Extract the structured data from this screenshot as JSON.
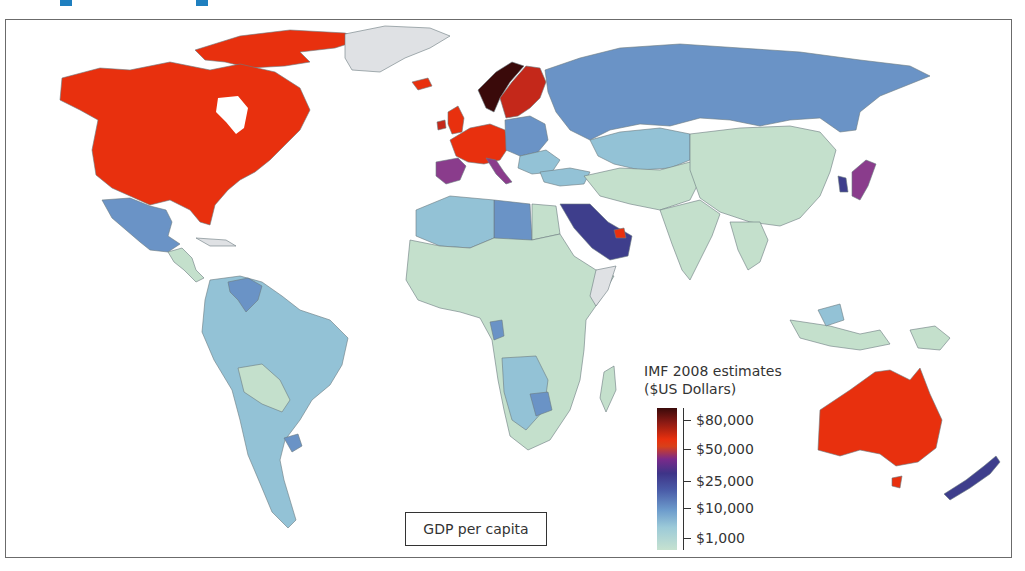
{
  "map": {
    "caption": "GDP per capita",
    "legend": {
      "title_line1": "IMF 2008 estimates",
      "title_line2": "($US Dollars)",
      "ticks": [
        "$80,000",
        "$50,000",
        "$25,000",
        "$10,000",
        "$1,000"
      ]
    },
    "colors": {
      "very_high": "#e8300e",
      "highest": "#3a0a0a",
      "high_purple": "#8a3c8c",
      "upper_mid": "#3e3e8c",
      "mid": "#6a93c6",
      "lower_mid": "#93c2d6",
      "low": "#c4e0cc",
      "no_data": "#dfe1e4"
    },
    "regions": [
      {
        "name": "North America (USA, Canada)",
        "band": "very_high"
      },
      {
        "name": "Greenland",
        "band": "no_data"
      },
      {
        "name": "Mexico",
        "band": "mid"
      },
      {
        "name": "Central America",
        "band": "low"
      },
      {
        "name": "South America",
        "band": "lower_mid"
      },
      {
        "name": "Venezuela",
        "band": "mid"
      },
      {
        "name": "Western Europe",
        "band": "very_high"
      },
      {
        "name": "Norway",
        "band": "highest"
      },
      {
        "name": "Spain/Italy",
        "band": "high_purple"
      },
      {
        "name": "Russia",
        "band": "mid"
      },
      {
        "name": "Kazakhstan",
        "band": "lower_mid"
      },
      {
        "name": "China",
        "band": "low"
      },
      {
        "name": "India",
        "band": "low"
      },
      {
        "name": "Japan",
        "band": "high_purple"
      },
      {
        "name": "South Korea",
        "band": "upper_mid"
      },
      {
        "name": "Saudi Arabia",
        "band": "upper_mid"
      },
      {
        "name": "UAE",
        "band": "very_high"
      },
      {
        "name": "Libya",
        "band": "mid"
      },
      {
        "name": "Africa",
        "band": "low"
      },
      {
        "name": "Southeast Asia",
        "band": "low"
      },
      {
        "name": "Australia",
        "band": "very_high"
      },
      {
        "name": "New Zealand",
        "band": "upper_mid"
      }
    ]
  }
}
